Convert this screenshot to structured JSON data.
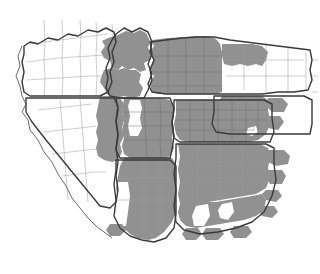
{
  "figure": {
    "kind": "choropleth-map",
    "region_name": "Western United States",
    "background_color": "#ffffff",
    "shaded_color": "#919191",
    "unshaded_color": "#ffffff",
    "state_border_color": "#3a3a3a",
    "county_border_color": "#9a9a9a",
    "has_title": false,
    "has_legend": false,
    "has_axis_labels": false,
    "has_text_labels": false,
    "width_px": 320,
    "height_px": 274
  },
  "map_data": {
    "type": "choropleth",
    "projection": "conic",
    "categories": [
      "shaded",
      "unshaded"
    ],
    "states": [
      {
        "name": "Oregon",
        "code": "OR",
        "fill": "unshaded",
        "position": "upper-left"
      },
      {
        "name": "Idaho",
        "code": "ID",
        "fill": "mixed",
        "position": "upper-center-left"
      },
      {
        "name": "Montana",
        "code": "MT",
        "fill": "mixed",
        "position": "upper-center"
      },
      {
        "name": "Wyoming",
        "code": "WY",
        "fill": "mixed",
        "position": "upper-right"
      },
      {
        "name": "Nevada",
        "code": "NV",
        "fill": "mixed",
        "position": "center-left"
      },
      {
        "name": "Utah",
        "code": "UT",
        "fill": "mixed",
        "position": "center"
      },
      {
        "name": "Colorado",
        "code": "CO",
        "fill": "shaded",
        "position": "center-right"
      },
      {
        "name": "California",
        "code": "CA",
        "fill": "unshaded",
        "position": "lower-left"
      },
      {
        "name": "Arizona",
        "code": "AZ",
        "fill": "mixed",
        "position": "lower-center"
      },
      {
        "name": "New Mexico",
        "code": "NM",
        "fill": "shaded",
        "position": "lower-right"
      }
    ],
    "notes": "County-level subdivisions drawn as thin gray outlines; state outlines drawn as thicker dark lines. Shaded counties form a contiguous block across eastern Nevada, Idaho, Utah, Colorado, Arizona and New Mexico."
  }
}
